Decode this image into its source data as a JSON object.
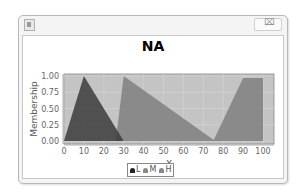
{
  "window": {
    "title": "",
    "icon": "java-app-icon",
    "close_button": "close-icon",
    "close_glyph": "⌧"
  },
  "chart_data": {
    "type": "area",
    "title": "NA",
    "xlabel": "X",
    "ylabel": "Membership",
    "xlim": [
      0,
      105
    ],
    "ylim": [
      0,
      1.05
    ],
    "x_ticks": [
      "0",
      "10",
      "20",
      "30",
      "40",
      "50",
      "60",
      "70",
      "80",
      "90",
      "100"
    ],
    "y_ticks": [
      "0.00",
      "0.25",
      "0.50",
      "0.75",
      "1.00"
    ],
    "grid": true,
    "legend_position": "bottom",
    "series": [
      {
        "name": "L",
        "color": "#555555",
        "points": [
          [
            0,
            0
          ],
          [
            10,
            1.0
          ],
          [
            30,
            0
          ]
        ]
      },
      {
        "name": "M",
        "color": "#888888",
        "points": [
          [
            26,
            0
          ],
          [
            30,
            1.0
          ],
          [
            76,
            0
          ]
        ]
      },
      {
        "name": "H",
        "color": "#8a8a8a",
        "points": [
          [
            75,
            0
          ],
          [
            90,
            0.97
          ],
          [
            100,
            0.97
          ],
          [
            100,
            0
          ]
        ]
      }
    ]
  },
  "legend": {
    "items": [
      {
        "label": "L",
        "color": "#222222"
      },
      {
        "label": "M",
        "color": "#888888"
      },
      {
        "label": "H",
        "color": "#888888"
      }
    ]
  }
}
